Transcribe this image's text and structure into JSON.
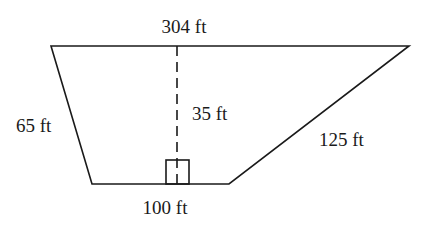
{
  "figure": {
    "type": "trapezoid",
    "colors": {
      "stroke": "#1a1a1a",
      "background": "#ffffff"
    },
    "labels": {
      "top_base": "304 ft",
      "bottom_base": "100 ft",
      "left_side": "65 ft",
      "right_side": "125 ft",
      "height": "35 ft"
    },
    "measurements": {
      "top_base_ft": 304,
      "bottom_base_ft": 100,
      "left_side_ft": 65,
      "right_side_ft": 125,
      "height_ft": 35,
      "unit": "ft"
    },
    "markers": {
      "right_angle": "right-angle box at foot of height line on bottom base"
    }
  }
}
